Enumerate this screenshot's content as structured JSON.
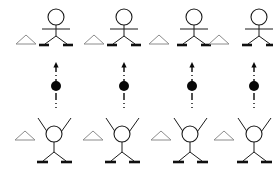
{
  "figure": {
    "background_color": "#ffffff",
    "ink_color": "#1a1a1a",
    "marker_color": "#8c8c8c",
    "ball_color": "#080808",
    "panel_count": 4,
    "panel_width": 68,
    "panel_height": 172
  },
  "chart_data": {
    "type": "diagram",
    "xlabel": "",
    "ylabel": "",
    "categories": [
      "panel-1",
      "panel-2",
      "panel-3",
      "panel-4"
    ],
    "series": [
      {
        "name": "marker-triangle-offset-top-px",
        "values": [
          18,
          18,
          14,
          10
        ]
      },
      {
        "name": "marker-triangle-offset-bottom-px",
        "values": [
          18,
          18,
          18,
          18
        ]
      },
      {
        "name": "ball-height-px",
        "values": [
          86,
          86,
          86,
          86
        ]
      }
    ]
  },
  "panels": [
    {
      "id": "panel-1",
      "label": "Panel 1",
      "x": 8,
      "thrower": {
        "pose": "arms-out",
        "head_cx": 48,
        "head_cy": 17,
        "head_r": 8,
        "torso_x": 48,
        "torso_y1": 25,
        "torso_y2": 36,
        "arms_y": 29,
        "arms_x1": 34,
        "arms_x2": 62,
        "leg_left_x": 37,
        "leg_right_x": 59,
        "leg_y": 44,
        "ski_left_x1": 31,
        "ski_left_x2": 41,
        "ski_right_x1": 55,
        "ski_right_x2": 65,
        "ski_y": 45
      },
      "marker": {
        "cx": 18,
        "cy": 44,
        "half_width": 10,
        "height": 9
      },
      "projectile": {
        "arrow_x": 48,
        "arrow_y_top": 62,
        "arrow_y_bottom": 108,
        "ball_cx": 48,
        "ball_cy": 86,
        "ball_r": 5
      },
      "catcher": {
        "pose": "arms-up-v",
        "head_cx": 46,
        "head_cy": 134,
        "head_r": 8,
        "torso_x": 46,
        "torso_y1": 142,
        "torso_y2": 152,
        "arm_left_x": 30,
        "arm_left_y": 118,
        "arm_right_x": 63,
        "arm_right_y": 118,
        "leg_left_x": 35,
        "leg_right_x": 58,
        "leg_y": 161,
        "ski_left_x1": 29,
        "ski_left_x2": 40,
        "ski_right_x1": 53,
        "ski_right_x2": 64,
        "ski_y": 162
      },
      "marker_bottom": {
        "cx": 17,
        "cy": 140,
        "half_width": 10,
        "height": 9
      }
    },
    {
      "id": "panel-2",
      "label": "Panel 2",
      "x": 76,
      "thrower": {
        "pose": "arms-out",
        "head_cx": 48,
        "head_cy": 17,
        "head_r": 8,
        "torso_x": 48,
        "torso_y1": 25,
        "torso_y2": 36,
        "arms_y": 29,
        "arms_x1": 34,
        "arms_x2": 62,
        "leg_left_x": 37,
        "leg_right_x": 59,
        "leg_y": 44,
        "ski_left_x1": 31,
        "ski_left_x2": 41,
        "ski_right_x1": 55,
        "ski_right_x2": 65,
        "ski_y": 45
      },
      "marker": {
        "cx": 18,
        "cy": 44,
        "half_width": 10,
        "height": 9
      },
      "projectile": {
        "arrow_x": 48,
        "arrow_y_top": 62,
        "arrow_y_bottom": 108,
        "ball_cx": 48,
        "ball_cy": 86,
        "ball_r": 5
      },
      "catcher": {
        "pose": "arms-up-v",
        "head_cx": 46,
        "head_cy": 134,
        "head_r": 8,
        "torso_x": 46,
        "torso_y1": 142,
        "torso_y2": 152,
        "arm_left_x": 30,
        "arm_left_y": 118,
        "arm_right_x": 63,
        "arm_right_y": 118,
        "leg_left_x": 35,
        "leg_right_x": 58,
        "leg_y": 161,
        "ski_left_x1": 29,
        "ski_left_x2": 40,
        "ski_right_x1": 53,
        "ski_right_x2": 64,
        "ski_y": 162
      },
      "marker_bottom": {
        "cx": 17,
        "cy": 140,
        "half_width": 10,
        "height": 9
      }
    },
    {
      "id": "panel-3",
      "label": "Panel 3",
      "x": 144,
      "thrower": {
        "pose": "arms-out",
        "head_cx": 50,
        "head_cy": 17,
        "head_r": 8,
        "torso_x": 50,
        "torso_y1": 25,
        "torso_y2": 36,
        "arms_y": 29,
        "arms_x1": 36,
        "arms_x2": 64,
        "leg_left_x": 39,
        "leg_right_x": 61,
        "leg_y": 44,
        "ski_left_x1": 33,
        "ski_left_x2": 43,
        "ski_right_x1": 57,
        "ski_right_x2": 67,
        "ski_y": 45
      },
      "marker": {
        "cx": 15,
        "cy": 44,
        "half_width": 10,
        "height": 9
      },
      "projectile": {
        "arrow_x": 48,
        "arrow_y_top": 62,
        "arrow_y_bottom": 108,
        "ball_cx": 48,
        "ball_cy": 86,
        "ball_r": 5
      },
      "catcher": {
        "pose": "arms-up-v",
        "head_cx": 46,
        "head_cy": 134,
        "head_r": 8,
        "torso_x": 46,
        "torso_y1": 142,
        "torso_y2": 152,
        "arm_left_x": 30,
        "arm_left_y": 118,
        "arm_right_x": 63,
        "arm_right_y": 118,
        "leg_left_x": 35,
        "leg_right_x": 58,
        "leg_y": 161,
        "ski_left_x1": 29,
        "ski_left_x2": 40,
        "ski_right_x1": 53,
        "ski_right_x2": 64,
        "ski_y": 162
      },
      "marker_bottom": {
        "cx": 17,
        "cy": 140,
        "half_width": 10,
        "height": 9
      }
    },
    {
      "id": "panel-4",
      "label": "Panel 4",
      "x": 206,
      "thrower": {
        "pose": "arms-out",
        "head_cx": 53,
        "head_cy": 17,
        "head_r": 8,
        "torso_x": 53,
        "torso_y1": 25,
        "torso_y2": 36,
        "arms_y": 29,
        "arms_x1": 39,
        "arms_x2": 67,
        "leg_left_x": 42,
        "leg_right_x": 64,
        "leg_y": 44,
        "ski_left_x1": 36,
        "ski_left_x2": 46,
        "ski_right_x1": 60,
        "ski_right_x2": 68,
        "ski_y": 45
      },
      "marker": {
        "cx": 13,
        "cy": 44,
        "half_width": 10,
        "height": 9
      },
      "projectile": {
        "arrow_x": 48,
        "arrow_y_top": 62,
        "arrow_y_bottom": 108,
        "ball_cx": 48,
        "ball_cy": 86,
        "ball_r": 5
      },
      "catcher": {
        "pose": "arms-up-v",
        "head_cx": 48,
        "head_cy": 134,
        "head_r": 8,
        "torso_x": 48,
        "torso_y1": 142,
        "torso_y2": 152,
        "arm_left_x": 32,
        "arm_left_y": 118,
        "arm_right_x": 65,
        "arm_right_y": 118,
        "leg_left_x": 37,
        "leg_right_x": 60,
        "leg_y": 161,
        "ski_left_x1": 31,
        "ski_left_x2": 42,
        "ski_right_x1": 55,
        "ski_right_x2": 66,
        "ski_y": 162
      },
      "marker_bottom": {
        "cx": 18,
        "cy": 140,
        "half_width": 10,
        "height": 9
      }
    }
  ]
}
